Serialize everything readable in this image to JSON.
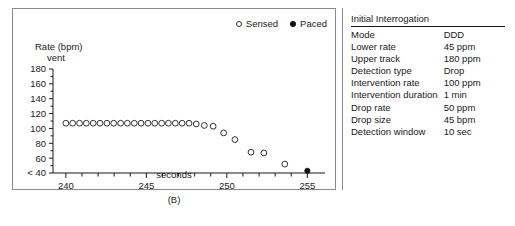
{
  "figure": {
    "caption": "(B)"
  },
  "chart_data": {
    "type": "scatter",
    "title": "",
    "xlabel": "seconds",
    "ylabel_line1": "Rate (bpm)",
    "ylabel_line2": "vent",
    "xlim": [
      239.2,
      255.6
    ],
    "ylim": [
      40,
      180
    ],
    "xticks": [
      240,
      241,
      242,
      243,
      244,
      245,
      246,
      247,
      248,
      249,
      250,
      251,
      252,
      253,
      254,
      255
    ],
    "xtick_labels": [
      "240",
      "",
      "",
      "",
      "",
      "245",
      "",
      "",
      "",
      "",
      "250",
      "",
      "",
      "",
      "",
      "255"
    ],
    "yticks": [
      40,
      50,
      60,
      70,
      80,
      90,
      100,
      110,
      120,
      130,
      140,
      150,
      160,
      170,
      180
    ],
    "ytick_labels": [
      "< 40",
      "",
      "60",
      "",
      "80",
      "",
      "100",
      "",
      "120",
      "",
      "140",
      "",
      "160",
      "",
      "180"
    ],
    "grid": false,
    "legend_position": "top-right",
    "series": [
      {
        "name": "Sensed",
        "marker": "open-circle",
        "color": "#333333",
        "points": [
          {
            "x": 240.0,
            "y": 107
          },
          {
            "x": 240.42,
            "y": 107
          },
          {
            "x": 240.85,
            "y": 107
          },
          {
            "x": 241.27,
            "y": 107
          },
          {
            "x": 241.7,
            "y": 107
          },
          {
            "x": 242.12,
            "y": 107
          },
          {
            "x": 242.55,
            "y": 107
          },
          {
            "x": 242.97,
            "y": 107
          },
          {
            "x": 243.4,
            "y": 107
          },
          {
            "x": 243.82,
            "y": 107
          },
          {
            "x": 244.25,
            "y": 107
          },
          {
            "x": 244.67,
            "y": 107
          },
          {
            "x": 245.1,
            "y": 107
          },
          {
            "x": 245.52,
            "y": 107
          },
          {
            "x": 245.95,
            "y": 107
          },
          {
            "x": 246.37,
            "y": 107
          },
          {
            "x": 246.8,
            "y": 107
          },
          {
            "x": 247.22,
            "y": 107
          },
          {
            "x": 247.65,
            "y": 107
          },
          {
            "x": 248.1,
            "y": 106
          },
          {
            "x": 248.6,
            "y": 104
          },
          {
            "x": 249.15,
            "y": 103
          },
          {
            "x": 249.8,
            "y": 94
          },
          {
            "x": 250.5,
            "y": 85
          },
          {
            "x": 251.5,
            "y": 68
          },
          {
            "x": 252.3,
            "y": 67
          },
          {
            "x": 253.6,
            "y": 52
          }
        ]
      },
      {
        "name": "Paced",
        "marker": "filled-circle",
        "color": "#111111",
        "points": [
          {
            "x": 255.0,
            "y": 43
          }
        ]
      }
    ]
  },
  "legend": {
    "items": [
      {
        "label": "Sensed",
        "marker": "open-circle"
      },
      {
        "label": "Paced",
        "marker": "filled-circle"
      }
    ]
  },
  "panel": {
    "title": "Initial Interrogation",
    "rows": [
      {
        "key": "Mode",
        "value": "DDD"
      },
      {
        "key": "Lower rate",
        "value": "45 ppm"
      },
      {
        "key": "Upper track",
        "value": "180 ppm"
      },
      {
        "key": "Detection type",
        "value": "Drop"
      },
      {
        "key": "Intervention rate",
        "value": "100 ppm"
      },
      {
        "key": "Intervention duration",
        "value": "1 min"
      },
      {
        "key": "Drop rate",
        "value": "50 ppm"
      },
      {
        "key": "Drop size",
        "value": "45 bpm"
      },
      {
        "key": "Detection window",
        "value": "10 sec"
      }
    ]
  }
}
